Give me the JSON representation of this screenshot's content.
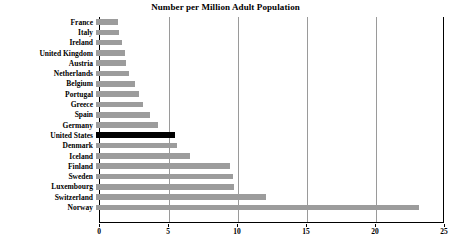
{
  "chart_data": {
    "type": "bar",
    "orientation": "horizontal",
    "title": "Number per Million Adult Population",
    "xlabel": "",
    "ylabel": "",
    "xlim": [
      0,
      25
    ],
    "xticks": [
      0,
      5,
      10,
      15,
      20,
      25
    ],
    "grid": true,
    "legend": "none",
    "highlight_category": "United States",
    "highlight_color": "#000000",
    "bar_color": "#9c9c9c",
    "categories": [
      "France",
      "Italy",
      "Ireland",
      "United Kingdom",
      "Austria",
      "Netherlands",
      "Belgium",
      "Portugal",
      "Greece",
      "Spain",
      "Germany",
      "United States",
      "Denmark",
      "Iceland",
      "Finland",
      "Sweden",
      "Luxembourg",
      "Switzerland",
      "Norway"
    ],
    "values": [
      1.6,
      1.7,
      1.9,
      2.1,
      2.2,
      2.4,
      2.8,
      3.1,
      3.4,
      3.9,
      4.5,
      5.7,
      5.9,
      6.8,
      9.7,
      9.9,
      10.0,
      12.3,
      23.4
    ]
  }
}
